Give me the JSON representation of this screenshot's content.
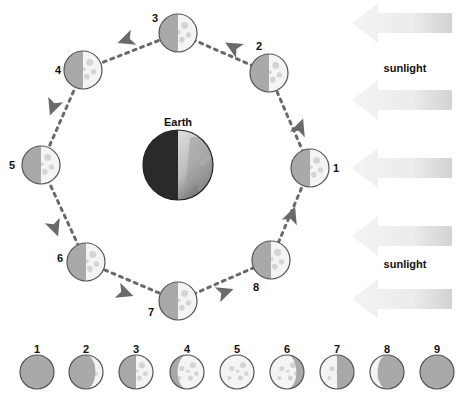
{
  "diagram": {
    "earth": {
      "label": "Earth",
      "cx": 178,
      "cy": 165,
      "r": 35
    },
    "sunlight": {
      "labels": [
        "sunlight",
        "sunlight"
      ],
      "label_positions": [
        [
          405,
          72
        ],
        [
          405,
          268
        ]
      ],
      "arrow_rows": [
        23,
        100,
        168,
        236,
        299
      ]
    },
    "colors": {
      "moon_dark": "#a9a9a9",
      "moon_lit": "#f4f4f4",
      "crater": "#d4d4d4",
      "outline": "#555555",
      "orbit_path": "#6a6a6a",
      "earth_night": "#2a2a2a",
      "earth_day": "#e8e8e8",
      "arrow_light": "#eeeeee",
      "arrow_dark": "#d2d2d2"
    },
    "orbit_moons": [
      {
        "id": "1",
        "cx": 310,
        "cy": 168,
        "label_x": 333,
        "label_y": 172
      },
      {
        "id": "2",
        "cx": 269,
        "cy": 73,
        "label_x": 256,
        "label_y": 50
      },
      {
        "id": "3",
        "cx": 178,
        "cy": 33,
        "label_x": 152,
        "label_y": 22
      },
      {
        "id": "4",
        "cx": 83,
        "cy": 70,
        "label_x": 55,
        "label_y": 74
      },
      {
        "id": "5",
        "cx": 41,
        "cy": 165,
        "label_x": 9,
        "label_y": 169
      },
      {
        "id": "6",
        "cx": 86,
        "cy": 262,
        "label_x": 57,
        "label_y": 262
      },
      {
        "id": "7",
        "cx": 178,
        "cy": 301,
        "label_x": 148,
        "label_y": 316
      },
      {
        "id": "8",
        "cx": 271,
        "cy": 260,
        "label_x": 253,
        "label_y": 291
      }
    ],
    "orbit_arrows": [
      {
        "x": 300,
        "y": 127,
        "angle": -70
      },
      {
        "x": 233,
        "y": 47,
        "angle": -150
      },
      {
        "x": 126,
        "y": 40,
        "angle": 160
      },
      {
        "x": 53,
        "y": 107,
        "angle": 110
      },
      {
        "x": 55,
        "y": 228,
        "angle": 70
      },
      {
        "x": 125,
        "y": 293,
        "angle": 20
      },
      {
        "x": 225,
        "y": 292,
        "angle": -20
      },
      {
        "x": 292,
        "y": 215,
        "angle": -70
      }
    ],
    "phase_row": {
      "labels": [
        "1",
        "2",
        "3",
        "4",
        "5",
        "6",
        "7",
        "8",
        "9"
      ],
      "centers_x": [
        37,
        86,
        136,
        187,
        237,
        287,
        337,
        387,
        437
      ],
      "cy": 372,
      "label_y": 353,
      "phases": [
        "new",
        "waxing-crescent",
        "first-quarter",
        "waxing-gibbous",
        "full",
        "waning-gibbous",
        "last-quarter",
        "waning-crescent",
        "new"
      ]
    }
  }
}
